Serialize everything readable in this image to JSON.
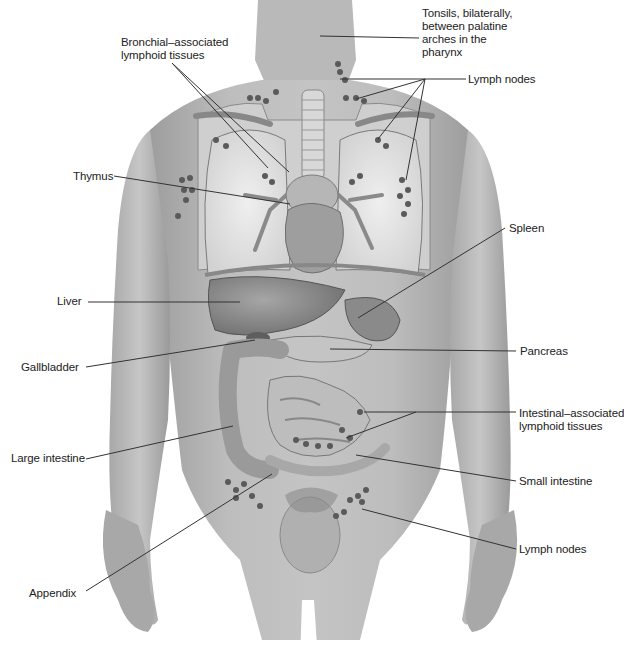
{
  "diagram": {
    "labels": [
      {
        "id": "tonsils",
        "text": "Tonsils, bilaterally,\nbetween palatine\narches in the\npharynx",
        "x": 422,
        "y": 7
      },
      {
        "id": "lymph-nodes-upper",
        "text": "Lymph nodes",
        "x": 468,
        "y": 73
      },
      {
        "id": "bronchial",
        "text": "Bronchial–associated\nlymphoid tissues",
        "x": 121,
        "y": 36
      },
      {
        "id": "thymus",
        "text": "Thymus",
        "x": 73,
        "y": 170
      },
      {
        "id": "spleen",
        "text": "Spleen",
        "x": 509,
        "y": 222
      },
      {
        "id": "liver",
        "text": "Liver",
        "x": 57,
        "y": 295
      },
      {
        "id": "gallbladder",
        "text": "Gallbladder",
        "x": 21,
        "y": 361
      },
      {
        "id": "pancreas",
        "text": "Pancreas",
        "x": 520,
        "y": 345
      },
      {
        "id": "intestinal",
        "text": "Intestinal–associated\nlymphoid tissues",
        "x": 519,
        "y": 407
      },
      {
        "id": "large-intestine",
        "text": "Large intestine",
        "x": 11,
        "y": 452
      },
      {
        "id": "small-intestine",
        "text": "Small intestine",
        "x": 519,
        "y": 475
      },
      {
        "id": "lymph-nodes-lower",
        "text": "Lymph nodes",
        "x": 519,
        "y": 543
      },
      {
        "id": "appendix",
        "text": "Appendix",
        "x": 29,
        "y": 587
      }
    ],
    "leader_lines": [
      {
        "for": "tonsils",
        "points": [
          [
            419,
            38
          ],
          [
            320,
            36
          ]
        ]
      },
      {
        "for": "lymph-nodes-upper",
        "points": [
          [
            466,
            79
          ],
          [
            425,
            79
          ],
          [
            340,
            79
          ]
        ]
      },
      {
        "for": "lymph-nodes-upper",
        "points": [
          [
            425,
            79
          ],
          [
            356,
            99
          ]
        ]
      },
      {
        "for": "lymph-nodes-upper",
        "points": [
          [
            425,
            79
          ],
          [
            378,
            139
          ]
        ]
      },
      {
        "for": "lymph-nodes-upper",
        "points": [
          [
            425,
            79
          ],
          [
            406,
            180
          ]
        ]
      },
      {
        "for": "bronchial",
        "points": [
          [
            172,
            63
          ],
          [
            289,
            172
          ]
        ]
      },
      {
        "for": "bronchial",
        "points": [
          [
            172,
            63
          ],
          [
            268,
            168
          ]
        ]
      },
      {
        "for": "thymus",
        "points": [
          [
            114,
            176
          ],
          [
            290,
            204
          ]
        ]
      },
      {
        "for": "spleen",
        "points": [
          [
            505,
            228
          ],
          [
            358,
            318
          ]
        ]
      },
      {
        "for": "liver",
        "points": [
          [
            88,
            302
          ],
          [
            240,
            302
          ]
        ]
      },
      {
        "for": "gallbladder",
        "points": [
          [
            86,
            367
          ],
          [
            255,
            340
          ]
        ]
      },
      {
        "for": "pancreas",
        "points": [
          [
            516,
            351
          ],
          [
            330,
            349
          ]
        ]
      },
      {
        "for": "intestinal",
        "points": [
          [
            516,
            412
          ],
          [
            364,
            412
          ]
        ]
      },
      {
        "for": "intestinal",
        "points": [
          [
            416,
            412
          ],
          [
            346,
            438
          ]
        ]
      },
      {
        "for": "large-intestine",
        "points": [
          [
            86,
            459
          ],
          [
            233,
            426
          ]
        ]
      },
      {
        "for": "small-intestine",
        "points": [
          [
            516,
            481
          ],
          [
            356,
            455
          ]
        ]
      },
      {
        "for": "lymph-nodes-lower",
        "points": [
          [
            516,
            549
          ],
          [
            362,
            509
          ]
        ]
      },
      {
        "for": "appendix",
        "points": [
          [
            86,
            591
          ],
          [
            272,
            474
          ]
        ]
      }
    ],
    "colors": {
      "background": "#ffffff",
      "skin": "#b4b4b4",
      "skin_shadow": "#8c8c8c",
      "lungs": "#e4e4e4",
      "organ_dark": "#6a6a6a",
      "organ_mid": "#9a9a9a",
      "organ_light": "#c8c8c8",
      "node": "#5a5a5a",
      "line": "#333333",
      "text": "#222222"
    }
  }
}
